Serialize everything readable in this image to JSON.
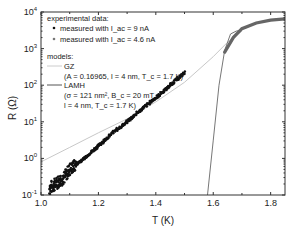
{
  "chart_data": {
    "type": "scatter",
    "title": "",
    "xlabel": "T (K)",
    "ylabel": "R (Ω)",
    "xlim": [
      1.0,
      1.85
    ],
    "ylim": [
      0.1,
      10000
    ],
    "yscale": "log",
    "x_ticks": [
      "1.0",
      "1.2",
      "1.4",
      "1.6",
      "1.8"
    ],
    "y_ticks": [
      "10^-1",
      "10^0",
      "10^1",
      "10^2",
      "10^3",
      "10^4"
    ],
    "grid": false,
    "legend_position": "upper-left",
    "legend": {
      "experimental_header": "experimental data:",
      "exp1": "measured with I_ac = 9 nA",
      "exp2": "measured with I_ac = 4.6 nA",
      "models_header": "models:",
      "gz_name": "GZ",
      "gz_params": "(A = 0.16965, l = 4 nm, T_c = 1.7 K)",
      "lamh_name": "LAMH",
      "lamh_params1": "(σ = 121 nm², B_c = 20 mT,",
      "lamh_params2": "l = 4 nm, T_c = 1.7 K)"
    },
    "series": [
      {
        "name": "measured with I_ac = 9 nA",
        "style": "black dots",
        "x": [
          1.03,
          1.05,
          1.08,
          1.1,
          1.15,
          1.2,
          1.25,
          1.3,
          1.35,
          1.4,
          1.45,
          1.5
        ],
        "y": [
          0.15,
          0.2,
          0.3,
          0.5,
          1.0,
          2.2,
          5,
          10,
          22,
          45,
          100,
          220
        ]
      },
      {
        "name": "measured with I_ac = 4.6 nA",
        "style": "gray dots",
        "x": [
          1.64,
          1.67,
          1.7,
          1.75,
          1.8,
          1.85
        ],
        "y": [
          800,
          2000,
          3500,
          5000,
          6000,
          6500
        ]
      },
      {
        "name": "GZ",
        "style": "light gray line",
        "x": [
          1.0,
          1.1,
          1.2,
          1.3,
          1.4,
          1.5,
          1.6,
          1.65,
          1.7
        ],
        "y": [
          0.8,
          2,
          5,
          12,
          35,
          120,
          600,
          1500,
          3000
        ]
      },
      {
        "name": "LAMH",
        "style": "gray line",
        "x": [
          1.58,
          1.6,
          1.62,
          1.64,
          1.66,
          1.68,
          1.7
        ],
        "y": [
          0.1,
          3,
          100,
          900,
          2500,
          3000,
          3200
        ]
      }
    ]
  }
}
